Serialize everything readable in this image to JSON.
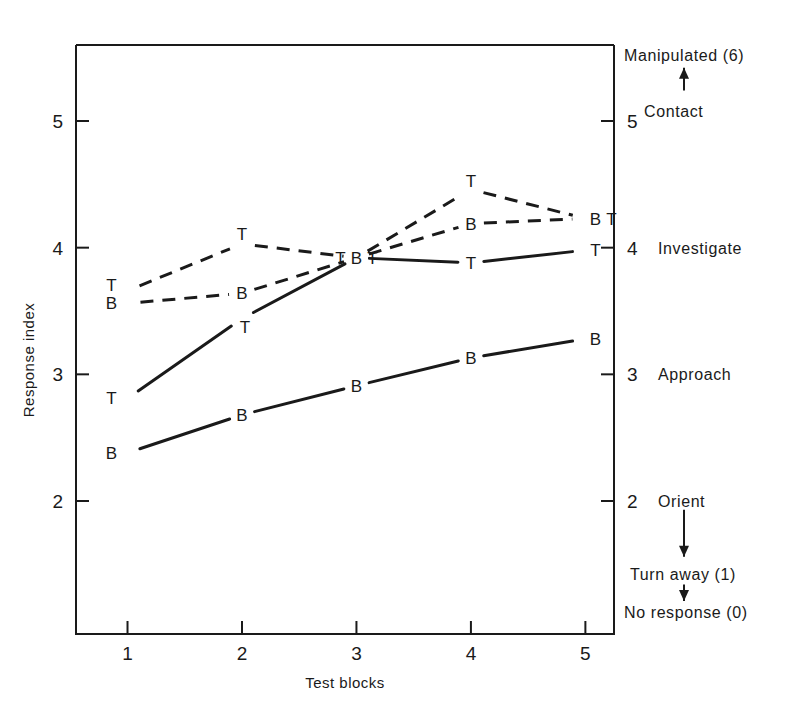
{
  "chart_data": {
    "type": "line",
    "title": "",
    "xlabel": "Test blocks",
    "ylabel": "Response index",
    "categories": [
      "1",
      "2",
      "3",
      "4",
      "5"
    ],
    "x": [
      1,
      2,
      3,
      4,
      5
    ],
    "xlim": [
      0.55,
      5.25
    ],
    "ylim": [
      0.95,
      5.6
    ],
    "grid": false,
    "legend_position": "none",
    "xticks": [
      "1",
      "2",
      "3",
      "4",
      "5"
    ],
    "yticks": [
      "2",
      "3",
      "4",
      "5"
    ],
    "ytick_values": [
      2,
      3,
      4,
      5
    ],
    "right_axis_ticks": [
      "2",
      "3",
      "4",
      "5"
    ],
    "series": [
      {
        "name": "T-dashed",
        "marker_label": "T",
        "linestyle": "dashed",
        "values": [
          3.66,
          4.03,
          3.92,
          4.46,
          4.23
        ]
      },
      {
        "name": "B-dashed",
        "marker_label": "B",
        "linestyle": "dashed",
        "values": [
          3.56,
          3.64,
          3.92,
          4.19,
          4.23
        ]
      },
      {
        "name": "T-solid",
        "marker_label": "T",
        "linestyle": "solid",
        "values": [
          2.81,
          3.44,
          3.92,
          3.88,
          3.98
        ]
      },
      {
        "name": "B-solid",
        "marker_label": "B",
        "linestyle": "solid",
        "values": [
          2.38,
          2.68,
          2.91,
          3.13,
          3.28
        ]
      }
    ],
    "point_labels": [
      {
        "block": 1,
        "text": "T",
        "value": 3.66,
        "series": "T-dashed",
        "dx": -16,
        "dy": 0
      },
      {
        "block": 1,
        "text": "B",
        "value": 3.56,
        "series": "B-dashed",
        "dx": -16,
        "dy": 6
      },
      {
        "block": 1,
        "text": "T",
        "value": 2.81,
        "series": "T-solid",
        "dx": -16,
        "dy": 6
      },
      {
        "block": 1,
        "text": "B",
        "value": 2.38,
        "series": "B-solid",
        "dx": -16,
        "dy": 6
      },
      {
        "block": 2,
        "text": "T",
        "value": 4.03,
        "series": "T-dashed",
        "dx": 0,
        "dy": -4
      },
      {
        "block": 2,
        "text": "B",
        "value": 3.64,
        "series": "B-dashed",
        "dx": 0,
        "dy": 6
      },
      {
        "block": 2,
        "text": "T",
        "value": 3.44,
        "series": "T-solid",
        "dx": 3,
        "dy": 14
      },
      {
        "block": 2,
        "text": "B",
        "value": 2.68,
        "series": "B-solid",
        "dx": 0,
        "dy": 6
      },
      {
        "block": 3,
        "text": "T",
        "value": 3.92,
        "series": "T-dashed",
        "dx": -16,
        "dy": 6
      },
      {
        "block": 3,
        "text": "B",
        "value": 3.92,
        "series": "B-dashed",
        "dx": 0,
        "dy": 6
      },
      {
        "block": 3,
        "text": "T",
        "value": 3.92,
        "series": "T-solid",
        "dx": 16,
        "dy": 6
      },
      {
        "block": 3,
        "text": "B",
        "value": 2.91,
        "series": "B-solid",
        "dx": 0,
        "dy": 6
      },
      {
        "block": 4,
        "text": "T",
        "value": 4.46,
        "series": "T-dashed",
        "dx": 0,
        "dy": -2
      },
      {
        "block": 4,
        "text": "B",
        "value": 4.19,
        "series": "B-dashed",
        "dx": 0,
        "dy": 6
      },
      {
        "block": 4,
        "text": "T",
        "value": 3.88,
        "series": "T-solid",
        "dx": 0,
        "dy": 6
      },
      {
        "block": 4,
        "text": "B",
        "value": 3.13,
        "series": "B-solid",
        "dx": 0,
        "dy": 6
      },
      {
        "block": 5,
        "text": "B",
        "value": 4.23,
        "series": "B-dashed",
        "dx": 10,
        "dy": 6
      },
      {
        "block": 5,
        "text": "T",
        "value": 4.23,
        "series": "T-dashed",
        "dx": 26,
        "dy": 6
      },
      {
        "block": 5,
        "text": "T",
        "value": 3.98,
        "series": "T-solid",
        "dx": 10,
        "dy": 6
      },
      {
        "block": 5,
        "text": "B",
        "value": 3.28,
        "series": "B-solid",
        "dx": 10,
        "dy": 6
      }
    ],
    "annotations": [
      {
        "name": "manipulated",
        "text": "Manipulated (6)",
        "y_value": 5.52,
        "x_px": 624
      },
      {
        "name": "contact",
        "text": "Contact",
        "y_value": 5.08,
        "x_px": 644
      },
      {
        "name": "investigate",
        "text": "Investigate",
        "y_value": 4.0,
        "x_px": 658
      },
      {
        "name": "approach",
        "text": "Approach",
        "y_value": 3.0,
        "x_px": 658
      },
      {
        "name": "orient",
        "text": "Orient",
        "y_value": 2.0,
        "x_px": 658
      },
      {
        "name": "turn-away",
        "text": "Turn away (1)",
        "y_value": 1.42,
        "x_px": 630
      },
      {
        "name": "no-response",
        "text": "No response (0)",
        "y_value": 1.12,
        "x_px": 624
      }
    ],
    "arrows": [
      {
        "name": "arrow-up-to-manipulated",
        "direction": "up",
        "x_px": 684,
        "y_from": 5.24,
        "y_to": 5.42
      },
      {
        "name": "arrow-down-orient-to-turn-away",
        "direction": "down",
        "x_px": 684,
        "y_from": 1.93,
        "y_to": 1.56
      },
      {
        "name": "arrow-down-turn-away-to-no-response",
        "direction": "down",
        "x_px": 684,
        "y_from": 1.34,
        "y_to": 1.21
      }
    ]
  },
  "colors": {
    "ink": "#1a1a1a",
    "background": "#ffffff"
  }
}
